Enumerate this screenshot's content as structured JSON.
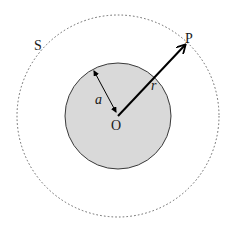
{
  "diagram": {
    "center": {
      "label": "O",
      "x": 118,
      "y": 116
    },
    "sphere": {
      "radius_label": "a",
      "radius_px": 53,
      "fill": "#d8d8d8",
      "stroke": "#333333"
    },
    "surface": {
      "label": "S",
      "radius_px": 101,
      "style": "dotted",
      "stroke": "#555555"
    },
    "point": {
      "label": "P"
    },
    "position_vector": {
      "label": "r",
      "color": "#000000"
    },
    "labels": {
      "O": "O",
      "a": "a",
      "r": "r",
      "P": "P",
      "S": "S"
    }
  }
}
